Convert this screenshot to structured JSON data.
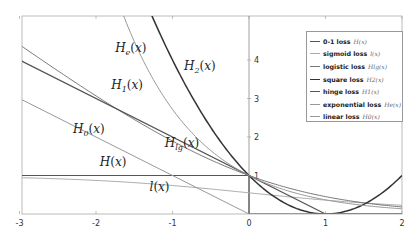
{
  "chart_data": {
    "type": "line",
    "title": "",
    "xlabel": "",
    "ylabel": "",
    "xlim": [
      -3,
      2
    ],
    "ylim": [
      0,
      5
    ],
    "grid": false,
    "legend_position": "upper right",
    "x_ticks": [
      "-3",
      "-2",
      "-1",
      "0",
      "1",
      "2"
    ],
    "y_ticks": [
      "1",
      "2",
      "3",
      "4"
    ],
    "series": [
      {
        "name": "0-1 loss",
        "symbol": "H(x)",
        "formula": "x<0 ? 1 : 0",
        "color": "#555555",
        "width": 1.2,
        "x": [
          -3,
          0,
          0,
          2
        ],
        "y": [
          1,
          1,
          0,
          0
        ]
      },
      {
        "name": "sigmoid loss",
        "symbol": "l(x)",
        "formula": "2/(1+e^x) approx (visual)",
        "color": "#aaaaaa",
        "width": 1.0,
        "x": [
          -3,
          -2,
          -1,
          0,
          1,
          2
        ],
        "y": [
          0.95,
          0.88,
          0.73,
          0.5,
          0.27,
          0.12
        ]
      },
      {
        "name": "logistic loss",
        "symbol": "H_lg(x)",
        "formula": "log2(1+e^-x)",
        "color": "#777777",
        "width": 1.0,
        "x": [
          -3,
          -2,
          -1,
          0,
          1,
          2
        ],
        "y": [
          4.37,
          3.06,
          1.89,
          1.0,
          0.45,
          0.18
        ]
      },
      {
        "name": "square loss",
        "symbol": "H_2(x)",
        "formula": "(1-x)^2",
        "color": "#333333",
        "width": 1.5,
        "x": [
          -1.22,
          -1,
          0,
          1,
          2
        ],
        "y": [
          4.93,
          4,
          1,
          0,
          1
        ]
      },
      {
        "name": "hinge loss",
        "symbol": "H_1(x)",
        "formula": "max(0,1-x)",
        "color": "#555555",
        "width": 1.2,
        "x": [
          -3,
          1,
          2
        ],
        "y": [
          4,
          0,
          0
        ]
      },
      {
        "name": "exponential loss",
        "symbol": "H_e(x)",
        "formula": "e^-x",
        "color": "#999999",
        "width": 1.0,
        "x": [
          -1.6,
          -1,
          0,
          1,
          2
        ],
        "y": [
          4.95,
          2.72,
          1.0,
          0.37,
          0.14
        ]
      },
      {
        "name": "linear loss",
        "symbol": "H_0(x)",
        "formula": "max(0,-x)",
        "color": "#999999",
        "width": 1.0,
        "x": [
          -3,
          0,
          2
        ],
        "y": [
          3,
          0,
          0
        ]
      }
    ],
    "annotations": [
      {
        "text": "H_e(x)",
        "x": -1.75,
        "y": 4.2
      },
      {
        "text": "H_2(x)",
        "x": -0.85,
        "y": 3.75
      },
      {
        "text": "H_1(x)",
        "x": -1.8,
        "y": 3.25
      },
      {
        "text": "H_0(x)",
        "x": -2.3,
        "y": 2.1
      },
      {
        "text": "H_lg(x)",
        "x": -1.1,
        "y": 1.75
      },
      {
        "text": "H(x)",
        "x": -1.95,
        "y": 1.25
      },
      {
        "text": "l(x)",
        "x": -1.3,
        "y": 0.6
      }
    ]
  },
  "legend": {
    "items": [
      {
        "label": "0-1 loss",
        "math": "H(x)"
      },
      {
        "label": "sigmoid loss",
        "math": "l(x)"
      },
      {
        "label": "logistic loss",
        "math": "Hlg(x)"
      },
      {
        "label": "square loss",
        "math": "H2(x)"
      },
      {
        "label": "hinge loss",
        "math": "H1(x)"
      },
      {
        "label": "exponential loss",
        "math": "He(x)"
      },
      {
        "label": "linear loss",
        "math": "H0(x)"
      }
    ]
  }
}
